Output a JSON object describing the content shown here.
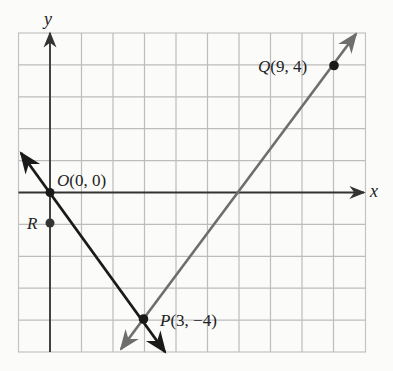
{
  "figure": {
    "axes": {
      "x_label": "x",
      "y_label": "y"
    },
    "grid": {
      "x_min": -1,
      "x_max": 10,
      "y_min": -5,
      "y_max": 5,
      "step": 1
    },
    "points": [
      {
        "id": "O",
        "name": "O",
        "coords": "(0, 0)",
        "x": 0,
        "y": 0,
        "label": "O(0, 0)"
      },
      {
        "id": "Q",
        "name": "Q",
        "coords": "(9, 4)",
        "x": 9,
        "y": 4,
        "label": "Q(9, 4)"
      },
      {
        "id": "P",
        "name": "P",
        "coords": "(3, −4)",
        "x": 3,
        "y": -4,
        "label": "P(3, −4)"
      },
      {
        "id": "R",
        "name": "R",
        "coords": "",
        "x": 0,
        "y": -1,
        "label": "R"
      }
    ],
    "lines": [
      {
        "id": "line-OP",
        "through": [
          "O",
          "P"
        ],
        "color": "#1a1a1a",
        "slope": "-4/3"
      },
      {
        "id": "line-PQ",
        "through": [
          "P",
          "Q"
        ],
        "color": "#6e6e6e",
        "slope": "4/3"
      }
    ],
    "colors": {
      "grid": "#b8b8b8",
      "axis": "#333333",
      "line_dark": "#1a1a1a",
      "line_gray": "#6e6e6e",
      "background": "#fbfbfa"
    }
  }
}
